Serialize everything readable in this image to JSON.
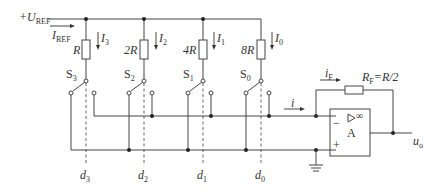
{
  "diagram": {
    "reference": {
      "label": "+U",
      "sub": "REF"
    },
    "reference_current": {
      "label": "I",
      "sub": "REF"
    },
    "branches": [
      {
        "resistor": "R",
        "current": "I",
        "current_sub": "3",
        "switch": "S",
        "switch_sub": "3",
        "bit": "d",
        "bit_sub": "3"
      },
      {
        "resistor": "2R",
        "current": "I",
        "current_sub": "2",
        "switch": "S",
        "switch_sub": "2",
        "bit": "d",
        "bit_sub": "2"
      },
      {
        "resistor": "4R",
        "current": "I",
        "current_sub": "1",
        "switch": "S",
        "switch_sub": "1",
        "bit": "d",
        "bit_sub": "1"
      },
      {
        "resistor": "8R",
        "current": "I",
        "current_sub": "0",
        "switch": "S",
        "switch_sub": "0",
        "bit": "d",
        "bit_sub": "0"
      }
    ],
    "sum_current": "i",
    "feedback_current": {
      "label": "i",
      "sub": "F"
    },
    "feedback_resistor": {
      "label": "R",
      "sub": "F",
      "value": "=R/2"
    },
    "opamp": {
      "name": "A",
      "symbol": "▷ ∞",
      "minus": "−",
      "plus": "+"
    },
    "output": {
      "label": "u",
      "sub": "o"
    }
  }
}
